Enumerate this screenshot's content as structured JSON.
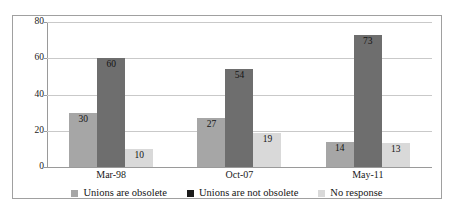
{
  "chart_data": {
    "type": "bar",
    "title": "",
    "subtitle": "",
    "xlabel": "",
    "ylabel": "",
    "categories": [
      "Mar-98",
      "Oct-07",
      "May-11"
    ],
    "series": [
      {
        "name": "Unions are obsolete",
        "color": "#a6a6a6",
        "values": [
          30,
          27,
          14
        ]
      },
      {
        "name": "Unions are not obsolete",
        "color": "#6e6e6e",
        "legend_color": "#1a1a1a",
        "values": [
          60,
          54,
          73
        ]
      },
      {
        "name": "No response",
        "color": "#d9d9d9",
        "values": [
          10,
          19,
          13
        ]
      }
    ],
    "ylim": [
      0,
      80
    ],
    "yticks": [
      0,
      20,
      40,
      60,
      80
    ],
    "ytick_labels": [
      "0",
      "20",
      "40",
      "60",
      "80"
    ],
    "grid": true,
    "grid_axis": "y",
    "legend_position": "bottom",
    "annotations": [
      "30",
      "60",
      "10",
      "27",
      "54",
      "19",
      "14",
      "73",
      "13"
    ]
  },
  "legend": {
    "items": [
      {
        "label": "Unions are obsolete",
        "swatch": "#a6a6a6"
      },
      {
        "label": "Unions are not obsolete",
        "swatch": "#1a1a1a"
      },
      {
        "label": "No response",
        "swatch": "#d9d9d9"
      }
    ]
  },
  "colors": {
    "background": "#ffffff",
    "frame": "#a0a0a0",
    "gridline": "#c9c9c9",
    "axis": "#9a9a9a",
    "text": "#141414"
  }
}
